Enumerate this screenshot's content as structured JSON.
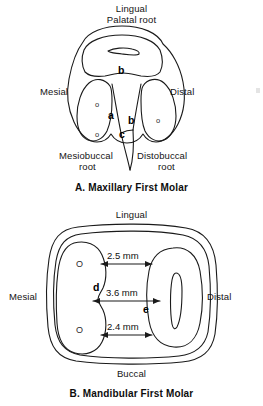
{
  "figure_a": {
    "caption": "A. Maxillary First Molar",
    "labels": {
      "top_line1": "Lingual",
      "top_line2": "Palatal root",
      "left": "Mesial",
      "right": "Distal",
      "bottom_left_line1": "Mesiobuccal",
      "bottom_left_line2": "root",
      "bottom_right_line1": "Distobuccal",
      "bottom_right_line2": "root"
    },
    "markers": [
      {
        "id": "a",
        "text": "a"
      },
      {
        "id": "b_palatal",
        "text": "b"
      },
      {
        "id": "b_distal",
        "text": "b"
      },
      {
        "id": "c",
        "text": "c"
      }
    ],
    "canal_markers": [
      {
        "id": "mb-canal-1",
        "text": "o"
      },
      {
        "id": "mb-canal-2",
        "text": "o"
      },
      {
        "id": "db-canal-1",
        "text": "o"
      }
    ]
  },
  "figure_b": {
    "caption": "B. Mandibular First Molar",
    "labels": {
      "top": "Lingual",
      "left": "Mesial",
      "right": "Distal",
      "bottom": "Buccal"
    },
    "markers": [
      {
        "id": "d",
        "text": "d"
      },
      {
        "id": "e",
        "text": "e"
      }
    ],
    "canal_markers": [
      {
        "id": "mesial-canal-1",
        "text": "O"
      },
      {
        "id": "mesial-canal-2",
        "text": "O"
      }
    ],
    "measurements": [
      {
        "id": "top-measure",
        "value": "2.5 mm"
      },
      {
        "id": "middle-measure",
        "value": "3.6 mm"
      },
      {
        "id": "bottom-measure",
        "value": "2.4 mm"
      }
    ]
  },
  "style": {
    "stroke": "#1a1a1a",
    "background": "#ffffff"
  }
}
